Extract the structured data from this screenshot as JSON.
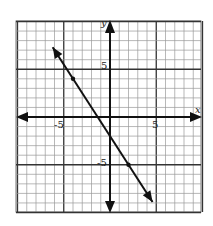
{
  "chart_data": {
    "type": "line",
    "title": "",
    "xlabel": "x",
    "ylabel": "y",
    "xlim": [
      -10,
      10
    ],
    "ylim": [
      -10,
      10
    ],
    "grid": true,
    "major_gridlines_every": 5,
    "x_tick_labels": [
      {
        "value": -5,
        "label": "-5"
      },
      {
        "value": 5,
        "label": "5"
      }
    ],
    "y_tick_labels": [
      {
        "value": 5,
        "label": "5"
      },
      {
        "value": -5,
        "label": "-5"
      }
    ],
    "series": [
      {
        "name": "line",
        "equation": "y = -3/2 x - 2",
        "slope": -1.5,
        "intercept": -2,
        "marked_points": [
          {
            "x": -4,
            "y": 4
          },
          {
            "x": 2,
            "y": -5
          }
        ],
        "arrow_ends": [
          {
            "x": -6.2,
            "y": 7.3
          },
          {
            "x": 4.6,
            "y": -8.9
          }
        ]
      }
    ]
  },
  "labels": {
    "x_axis": "x",
    "y_axis": "y",
    "x_neg5": "-5",
    "x_pos5": "5",
    "y_pos5": "5",
    "y_neg5": "-5"
  }
}
